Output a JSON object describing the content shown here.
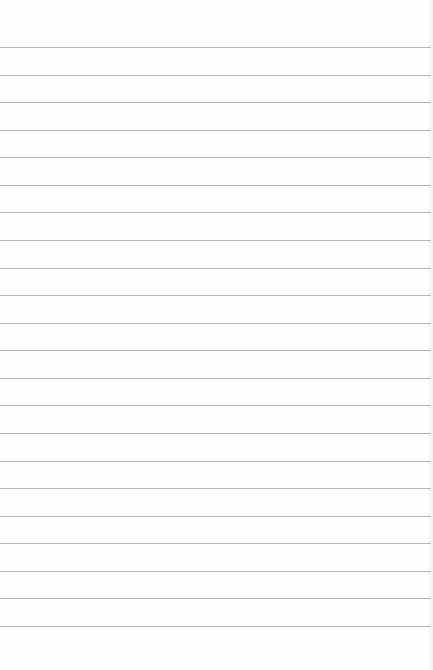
{
  "paper": {
    "type": "lined-paper",
    "background_color": "#fdfdfd",
    "line_color": "#b4b4b4",
    "line_count": 22,
    "first_line_y": 47,
    "line_spacing": 27.57
  }
}
